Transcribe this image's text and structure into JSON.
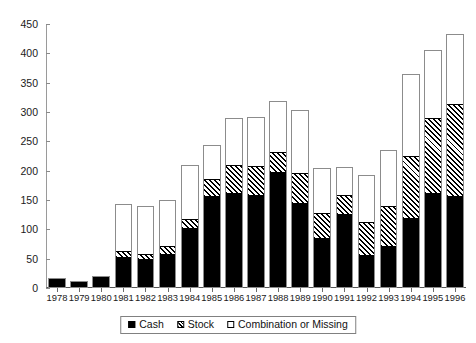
{
  "chart_data": {
    "type": "bar",
    "subtype": "stacked-vertical",
    "title": "",
    "subtitle": "",
    "xlabel": "",
    "ylabel": "",
    "ylim": [
      0,
      450
    ],
    "ytick_step": 50,
    "yticks": [
      "0",
      "50",
      "100",
      "150",
      "200",
      "250",
      "300",
      "350",
      "400",
      "450"
    ],
    "grid": false,
    "legend_position": "bottom-center",
    "categories": [
      "1978",
      "1979",
      "1980",
      "1981",
      "1982",
      "1983",
      "1984",
      "1985",
      "1986",
      "1987",
      "1988",
      "1989",
      "1990",
      "1991",
      "1992",
      "1993",
      "1994",
      "1995",
      "1996"
    ],
    "series": [
      {
        "name": "Cash",
        "color": "#000000",
        "fill": "solid-black",
        "values": [
          14,
          12,
          19,
          50,
          47,
          56,
          100,
          155,
          160,
          157,
          197,
          143,
          83,
          125,
          53,
          70,
          117,
          160,
          155
        ]
      },
      {
        "name": "Stock",
        "color": "#000000",
        "fill": "diagonal-hatch",
        "values": [
          3,
          0,
          2,
          12,
          10,
          15,
          18,
          32,
          50,
          52,
          35,
          53,
          45,
          35,
          60,
          70,
          108,
          130,
          160
        ]
      },
      {
        "name": "Combination or Missing",
        "color": "#ffffff",
        "fill": "white",
        "values": [
          0,
          0,
          0,
          81,
          82,
          79,
          91,
          57,
          80,
          82,
          86,
          107,
          77,
          46,
          80,
          95,
          140,
          115,
          118
        ]
      }
    ],
    "totals": [
      17,
      12,
      21,
      143,
      139,
      150,
      209,
      244,
      290,
      291,
      318,
      303,
      205,
      206,
      193,
      235,
      365,
      405,
      433
    ],
    "legend": [
      {
        "label": "Cash",
        "swatch": "solid-black-square-icon"
      },
      {
        "label": "Stock",
        "swatch": "hatched-square-icon"
      },
      {
        "label": "Combination or Missing",
        "swatch": "white-square-icon"
      }
    ]
  }
}
